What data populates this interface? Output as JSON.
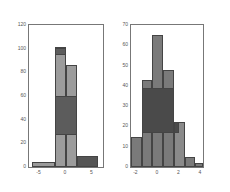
{
  "chart_data": [
    {
      "type": "bar",
      "title": "",
      "xlabel": "",
      "ylabel": "",
      "xlim": [
        -7,
        7
      ],
      "ylim": [
        0,
        120
      ],
      "xticks": [
        -5,
        0,
        5
      ],
      "yticks": [
        0,
        20,
        40,
        60,
        80,
        100,
        120
      ],
      "grid": false,
      "bins": [
        {
          "x0": -6.5,
          "x1": -2,
          "value": 4,
          "color": "#9a9a9a"
        },
        {
          "x0": -2,
          "x1": 0,
          "value": 101,
          "color": "#9c9c9c"
        },
        {
          "x0": 0,
          "x1": 2,
          "value": 86,
          "color": "#9c9c9c"
        },
        {
          "x0": 2,
          "x1": 6,
          "value": 9,
          "color": "#555555"
        }
      ],
      "layers": [
        {
          "x0": -2,
          "x1": 2,
          "y0": 27,
          "y1": 60,
          "color": "#5c5c5c"
        },
        {
          "x0": -2,
          "x1": 0,
          "y0": 95,
          "y1": 101,
          "color": "#5c5c5c"
        }
      ]
    },
    {
      "type": "bar",
      "title": "",
      "xlabel": "",
      "ylabel": "",
      "xlim": [
        -2.5,
        4.2
      ],
      "ylim": [
        0,
        70
      ],
      "xticks": [
        -2,
        0,
        2,
        4
      ],
      "yticks": [
        0,
        10,
        20,
        30,
        40,
        50,
        60,
        70
      ],
      "grid": false,
      "bins": [
        {
          "x0": -2.5,
          "x1": -1.5,
          "value": 15,
          "color": "#7a7a7a"
        },
        {
          "x0": -1.5,
          "x1": -0.5,
          "value": 43,
          "color": "#7a7a7a"
        },
        {
          "x0": -0.5,
          "x1": 0.5,
          "value": 65,
          "color": "#7a7a7a"
        },
        {
          "x0": 0.5,
          "x1": 1.5,
          "value": 48,
          "color": "#7a7a7a"
        },
        {
          "x0": 1.5,
          "x1": 2.5,
          "value": 22,
          "color": "#8a8a8a"
        },
        {
          "x0": 2.5,
          "x1": 3.5,
          "value": 5,
          "color": "#7a7a7a"
        },
        {
          "x0": 3.5,
          "x1": 4.2,
          "value": 2,
          "color": "#7a7a7a"
        }
      ],
      "layers": [
        {
          "x0": -1.5,
          "x1": 1.5,
          "y0": 17,
          "y1": 39,
          "color": "#4a4a4a"
        },
        {
          "x0": 1.5,
          "x1": 2.0,
          "y0": 17,
          "y1": 22,
          "color": "#4a4a4a"
        }
      ]
    }
  ]
}
